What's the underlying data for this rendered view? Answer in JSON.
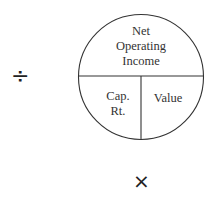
{
  "diagram": {
    "top_section": {
      "line1": "Net",
      "line2": "Operating",
      "line3": "Income"
    },
    "bottom_left": {
      "line1": "Cap.",
      "line2": "Rt."
    },
    "bottom_right": {
      "label": "Value"
    },
    "operators": {
      "divide": "÷",
      "multiply": "×"
    }
  }
}
